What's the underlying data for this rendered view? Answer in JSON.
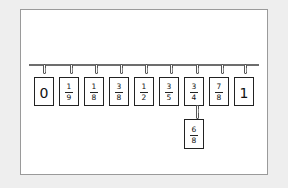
{
  "diagram": {
    "rope": {
      "color": "#6d6d6d"
    },
    "cards": [
      {
        "id": "zero",
        "type": "whole",
        "value": "0",
        "x": 34
      },
      {
        "id": "one-ninth",
        "type": "fraction",
        "numerator": "1",
        "denominator": "9",
        "x": 59
      },
      {
        "id": "one-eighth",
        "type": "fraction",
        "numerator": "1",
        "denominator": "8",
        "x": 84
      },
      {
        "id": "three-eighths",
        "type": "fraction",
        "numerator": "3",
        "denominator": "8",
        "x": 109
      },
      {
        "id": "one-half",
        "type": "fraction",
        "numerator": "1",
        "denominator": "2",
        "x": 134
      },
      {
        "id": "three-fifths",
        "type": "fraction",
        "numerator": "3",
        "denominator": "5",
        "x": 159
      },
      {
        "id": "three-quarters",
        "type": "fraction",
        "numerator": "3",
        "denominator": "4",
        "x": 184
      },
      {
        "id": "seven-eighths",
        "type": "fraction",
        "numerator": "7",
        "denominator": "8",
        "x": 209
      },
      {
        "id": "one",
        "type": "whole",
        "value": "1",
        "x": 234
      }
    ],
    "hanging_card": {
      "id": "six-eighths",
      "type": "fraction",
      "numerator": "6",
      "denominator": "8",
      "hangs_below": "three-quarters",
      "x": 184
    }
  }
}
